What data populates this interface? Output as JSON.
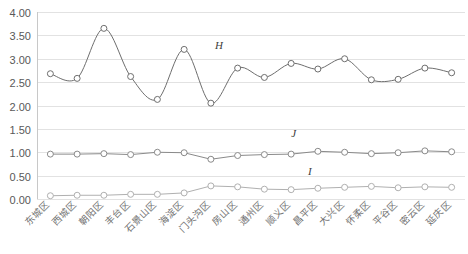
{
  "chart_data": {
    "type": "line",
    "title": "",
    "subtitle": "",
    "xlabel": "",
    "ylabel": "",
    "ylim": [
      0.0,
      4.0
    ],
    "ytick_step": 0.5,
    "ytick_labels": [
      "0.00",
      "0.50",
      "1.00",
      "1.50",
      "2.00",
      "2.50",
      "3.00",
      "3.50",
      "4.00"
    ],
    "grid": true,
    "legend_position": "inline-annotation",
    "categories": [
      "东城区",
      "西城区",
      "朝阳区",
      "丰台区",
      "石景山区",
      "海淀区",
      "门头沟区",
      "房山区",
      "通州区",
      "顺义区",
      "昌平区",
      "大兴区",
      "怀柔区",
      "平谷区",
      "密云区",
      "延庆区"
    ],
    "series": [
      {
        "name": "H",
        "label": "H",
        "color": "#6e6e6e",
        "marker": "circle-open",
        "smooth": true,
        "label_x_index": 6.3,
        "label_y_value": 3.22,
        "values": [
          2.68,
          2.58,
          3.65,
          2.62,
          2.13,
          3.2,
          2.05,
          2.8,
          2.6,
          2.9,
          2.78,
          3.0,
          2.55,
          2.56,
          2.8,
          2.7
        ]
      },
      {
        "name": "J",
        "label": "J",
        "color": "#8a8a8a",
        "marker": "circle-open",
        "smooth": false,
        "label_x_index": 9.1,
        "label_y_value": 1.33,
        "values": [
          0.96,
          0.96,
          0.97,
          0.95,
          1.0,
          0.99,
          0.85,
          0.93,
          0.95,
          0.96,
          1.02,
          1.0,
          0.97,
          0.99,
          1.03,
          1.01
        ]
      },
      {
        "name": "I",
        "label": "I",
        "color": "#b0b0b0",
        "marker": "circle-open",
        "smooth": false,
        "label_x_index": 9.7,
        "label_y_value": 0.52,
        "values": [
          0.07,
          0.08,
          0.08,
          0.1,
          0.1,
          0.13,
          0.28,
          0.26,
          0.21,
          0.2,
          0.23,
          0.25,
          0.27,
          0.24,
          0.26,
          0.25
        ]
      }
    ]
  },
  "plot_geometry": {
    "left": 37,
    "right": 465,
    "top": 12,
    "bottom": 199,
    "xtick_rotation": -45
  }
}
